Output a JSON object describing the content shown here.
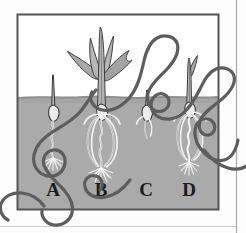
{
  "figure": {
    "kind": "scanned-textbook-illustration",
    "page_background": "#fdfdfd",
    "frame": {
      "name": "illustration-border",
      "stroke_color": "#555555",
      "x": 17,
      "y": 14,
      "width": 202,
      "height": 196
    },
    "right_margin_rule": {
      "name": "page-edge-rule",
      "stroke_color": "#9a9a9a",
      "x": 236,
      "y": 0,
      "height": 233
    },
    "bottom_margin_rule": {
      "name": "page-bottom-rule",
      "stroke_color": "#c8c8c8",
      "y": 226
    }
  },
  "colors": {
    "soil": "#aaaaaa",
    "soil_top_shade": "#9b9b9b",
    "sky": "#ffffff",
    "plant_fill": "#a8a8a8",
    "plant_stroke": "#3d3d3d",
    "seed_fill": "#e8e8e8",
    "seed_stroke": "#3f3f3f",
    "root_stroke": "#f2f2f2",
    "root_dark_stroke": "#4a4a4a",
    "label_text": "#1c1c1c",
    "scribble": "#5d5d5d",
    "frame": "#555555"
  },
  "soil": {
    "name": "soil-region",
    "surface_y": 97,
    "bottom_y": 210,
    "left_x": 18,
    "right_x": 218,
    "fill": "#aaaaaa"
  },
  "sky": {
    "name": "air-region",
    "top_y": 15,
    "bottom_y": 97,
    "fill": "#ffffff"
  },
  "labels": [
    {
      "id": "A",
      "text": "A",
      "x": 53,
      "y": 196
    },
    {
      "id": "B",
      "text": "B",
      "x": 101,
      "y": 196
    },
    {
      "id": "C",
      "text": "C",
      "x": 146,
      "y": 196
    },
    {
      "id": "D",
      "text": "D",
      "x": 189,
      "y": 196
    }
  ],
  "seedlings": [
    {
      "id": "A",
      "name": "seedling-a",
      "description": "Germinating seed: single thin shoot above soil, oval seed at soil line, wavy primary root ending in fibrous root tuft",
      "center_x": 53,
      "shoot_top_y": 75,
      "seed_y": 113,
      "root_tip_y": 168,
      "has_leaves": false,
      "leaf_count": 0,
      "adventitious_roots": 0
    },
    {
      "id": "B",
      "name": "seedling-b",
      "description": "Most developed plant: tall stem with four long arching grass leaves above soil, seed at soil line, spreading crown of adventitious roots plus wavy primary root to fibrous tuft",
      "center_x": 101,
      "shoot_top_y": 27,
      "seed_y": 113,
      "root_tip_y": 180,
      "has_leaves": true,
      "leaf_count": 4,
      "adventitious_roots": 6
    },
    {
      "id": "C",
      "name": "seedling-c",
      "description": "Earliest stage: very short shoot barely above soil, seed just under the surface, few short roots",
      "center_x": 146,
      "shoot_top_y": 90,
      "seed_y": 114,
      "root_tip_y": 140,
      "has_leaves": false,
      "leaf_count": 0,
      "adventitious_roots": 2
    },
    {
      "id": "D",
      "name": "seedling-d",
      "description": "Intermediate stage: upright shoot with one small emerging leaf, seed at soil line, developed crown of adventitious roots and fibrous root tuft",
      "center_x": 189,
      "shoot_top_y": 58,
      "seed_y": 111,
      "root_tip_y": 172,
      "has_leaves": true,
      "leaf_count": 1,
      "adventitious_roots": 6
    }
  ],
  "scribble": {
    "name": "pen-scribble-overlay",
    "description": "Looping dark-gray hand-drawn pen scribble crossing the lower right of the illustration and extending past the frame",
    "stroke_color": "#5d5d5d",
    "stroke_width": 3.2
  }
}
